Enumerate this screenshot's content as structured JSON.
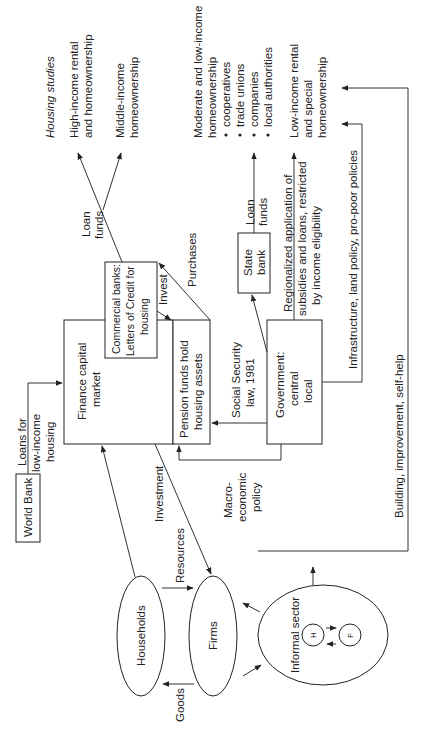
{
  "diagram": {
    "orientation": "rotated 90 degrees counter-clockwise",
    "outcomes": {
      "heading": "Housing studies",
      "high_income": [
        "High-income rental",
        "and homeownership"
      ],
      "middle_income": [
        "Middle-income",
        "homeownership"
      ],
      "moderate_low": [
        "Moderate and low-income",
        "homeownership"
      ],
      "moderate_low_items": [
        "cooperatives",
        "trade unions",
        "companies",
        "local authorities"
      ],
      "low_income": [
        "Low-income rental",
        "and special",
        "homeownership"
      ]
    },
    "nodes": {
      "finance": [
        "Finance capital",
        "market"
      ],
      "commercial_banks": [
        "Commercial banks:",
        "Letters of Credit for",
        "housing"
      ],
      "pension": [
        "Pension funds hold",
        "housing assets"
      ],
      "government": [
        "Government:",
        "central",
        "local"
      ],
      "state_bank": [
        "State",
        "bank"
      ],
      "world_bank": "World Bank",
      "households": "Households",
      "firms": "Firms",
      "informal": "Informal sector",
      "informal_h": "H",
      "informal_f": "F"
    },
    "edge_labels": {
      "loan_funds_1": [
        "Loan",
        "funds"
      ],
      "loan_funds_2": [
        "Loan",
        "funds"
      ],
      "purchases": "Purchases",
      "invest": "Invest",
      "regionalized": [
        "Regionalized application of",
        "subsidies and loans, restricted",
        "by income eligibility"
      ],
      "infrastructure": "Infrastructure, land policy, pro-poor policies",
      "building": "Building, improvement, self-help",
      "social_security": [
        "Social Security",
        "law, 1981"
      ],
      "loans_low_income": [
        "Loans for",
        "low-income",
        "housing"
      ],
      "investment": "Investment",
      "macro": [
        "Macro-",
        "economic",
        "policy"
      ],
      "resources": "Resources",
      "goods": "Goods"
    }
  }
}
